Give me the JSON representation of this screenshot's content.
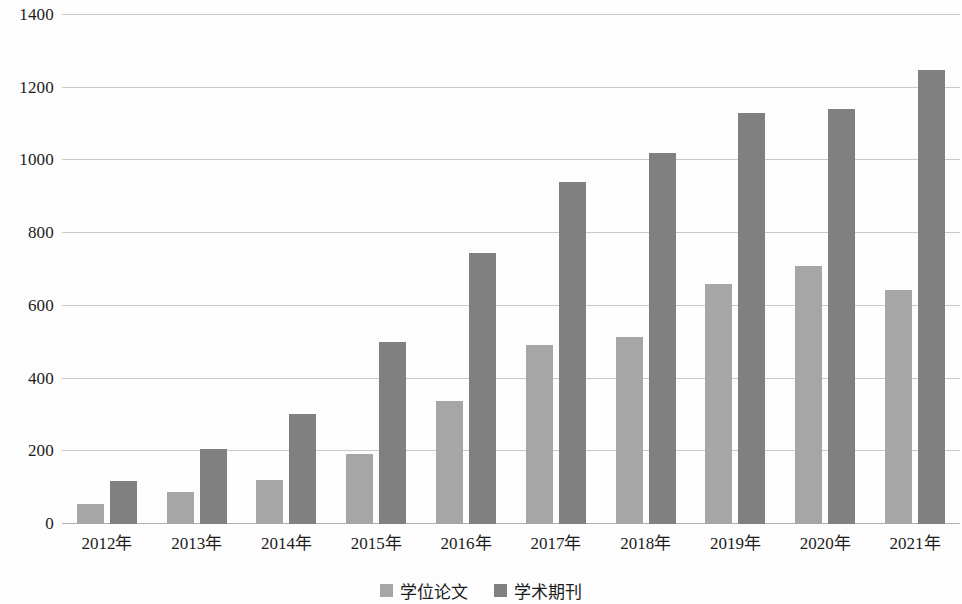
{
  "chart_data": {
    "type": "bar",
    "title": "",
    "subtitle": "",
    "xlabel": "",
    "ylabel": "",
    "categories": [
      "2012年",
      "2013年",
      "2014年",
      "2015年",
      "2016年",
      "2017年",
      "2018年",
      "2019年",
      "2020年",
      "2021年"
    ],
    "series": [
      {
        "name": "学位论文",
        "color": "#a6a6a6",
        "values": [
          55,
          88,
          120,
          193,
          338,
          492,
          515,
          660,
          710,
          643
        ]
      },
      {
        "name": "学术期刊",
        "color": "#808080",
        "values": [
          118,
          207,
          302,
          500,
          745,
          940,
          1020,
          1130,
          1142,
          1250
        ]
      }
    ],
    "ylim": [
      0,
      1400
    ],
    "ytick_labels": [
      "0",
      "200",
      "400",
      "600",
      "800",
      "1000",
      "1200",
      "1400"
    ],
    "ytick_values": [
      0,
      200,
      400,
      600,
      800,
      1000,
      1200,
      1400
    ],
    "grid": true,
    "legend_position": "bottom"
  }
}
